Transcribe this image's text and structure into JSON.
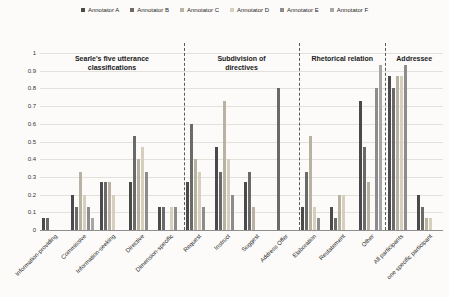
{
  "chart_data": {
    "type": "bar",
    "title": "",
    "ylabel": "",
    "xlabel": "",
    "ylim": [
      0,
      1
    ],
    "grid": true,
    "legend_position": "top-center",
    "y_tick_labels": [
      "0",
      "0.1",
      "0.2",
      "0.3",
      "0.4",
      "0.5",
      "0.6",
      "0.7",
      "0.8",
      "0.9",
      "1"
    ],
    "series_names": [
      "Annotator A",
      "Annotator B",
      "Annotator C",
      "Annotator D",
      "Annotator E",
      "Annotator F"
    ],
    "series_colors": [
      "#4a4a4a",
      "#6a6a6a",
      "#b8b2a2",
      "#d6cfbd",
      "#8c8c8c",
      "#a6a6a6"
    ],
    "sections": [
      {
        "title": "Searle's five utterance\nclassifications",
        "categories": [
          {
            "label": "Information-providing",
            "values": [
              0.07,
              0.07,
              0,
              0,
              0,
              0
            ]
          },
          {
            "label": "Commissive",
            "values": [
              0.2,
              0.13,
              0.33,
              0.2,
              0.13,
              0.07
            ]
          },
          {
            "label": "Information-seeking",
            "values": [
              0.27,
              0.27,
              0.27,
              0.2,
              0,
              0
            ]
          },
          {
            "label": "Directive",
            "values": [
              0.27,
              0.53,
              0.4,
              0.47,
              0.33,
              0
            ]
          },
          {
            "label": "Dimension-specific",
            "values": [
              0.13,
              0.13,
              0,
              0.13,
              0.13,
              0
            ]
          }
        ]
      },
      {
        "title": "Subdivision of\ndirectives",
        "categories": [
          {
            "label": "Request",
            "values": [
              0.27,
              0.6,
              0.4,
              0.33,
              0.13,
              0
            ]
          },
          {
            "label": "Instruct",
            "values": [
              0.47,
              0.33,
              0.73,
              0.4,
              0.2,
              0
            ]
          },
          {
            "label": "Suggest",
            "values": [
              0.27,
              0.33,
              0.13,
              0,
              0,
              0
            ]
          },
          {
            "label": "Address Offer",
            "values": [
              0,
              0.8,
              0,
              0,
              0,
              0
            ]
          }
        ]
      },
      {
        "title": "Rhetorical relation",
        "categories": [
          {
            "label": "Elaboration",
            "values": [
              0.13,
              0.33,
              0.53,
              0.13,
              0.07,
              0
            ]
          },
          {
            "label": "Restatement",
            "values": [
              0.13,
              0.07,
              0.2,
              0.2,
              0,
              0
            ]
          },
          {
            "label": "Other",
            "values": [
              0.73,
              0.47,
              0.27,
              0,
              0.8,
              0.93
            ]
          }
        ]
      },
      {
        "title": "Addressee",
        "categories": [
          {
            "label": "All participants",
            "values": [
              0.87,
              0.8,
              0.87,
              0.87,
              0.93,
              0
            ]
          },
          {
            "label": "one specific participant",
            "values": [
              0.2,
              0.13,
              0.07,
              0.07,
              0,
              0
            ]
          }
        ]
      }
    ]
  }
}
